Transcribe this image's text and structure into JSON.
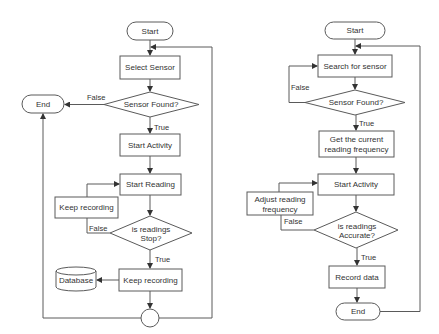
{
  "left_flowchart": {
    "start": "Start",
    "select_sensor": "Select Sensor",
    "sensor_found": "Sensor Found?",
    "false_label": "False",
    "end": "End",
    "true_label_1": "True",
    "start_activity": "Start Activity",
    "start_reading": "Start Reading",
    "keep_recording_loop": "Keep recording",
    "false_label_2": "False",
    "is_readings_stop_line1": "is readings",
    "is_readings_stop_line2": "Stop?",
    "true_label_2": "True",
    "keep_recording": "Keep recording",
    "database": "Database"
  },
  "right_flowchart": {
    "start": "Start",
    "search_for_sensor": "Search for sensor",
    "false_label": "False",
    "sensor_found": "Sensor Found?",
    "true_label_1": "True",
    "get_frequency_line1": "Get the current",
    "get_frequency_line2": "reading frequency",
    "start_activity": "Start Activity",
    "adjust_line1": "Adjust reading",
    "adjust_line2": "frequency",
    "false_label_2": "False",
    "is_readings_accurate_line1": "is readings",
    "is_readings_accurate_line2": "Accurate?",
    "true_label_2": "True",
    "record_data": "Record data",
    "end": "End"
  },
  "colors": {
    "stroke": "#5a5a5a",
    "text": "#333333",
    "background": "#ffffff"
  }
}
